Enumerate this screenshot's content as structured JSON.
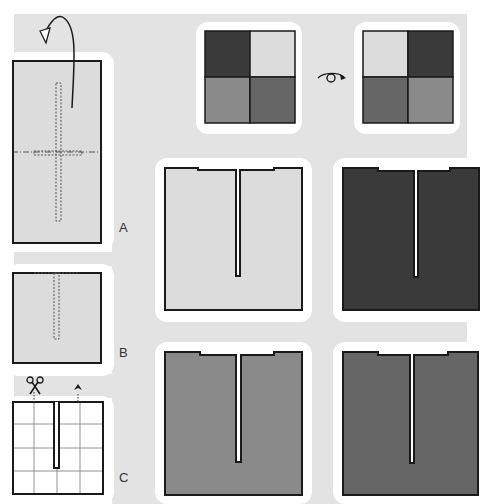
{
  "diagram": {
    "title": "",
    "steps": [
      {
        "id": "A",
        "label": "A",
        "description": "Rectangle with cross-shaped dotted cut guide; fold-over arrow at top"
      },
      {
        "id": "B",
        "label": "B",
        "description": "Folded square with dotted slit guide from top edge"
      },
      {
        "id": "C",
        "label": "C",
        "description": "4x4 grid square with slit cut from top; scissors and arrow markers"
      }
    ],
    "color_key": {
      "before": [
        "dark",
        "light",
        "mid",
        "darker-mid"
      ],
      "after": [
        "light",
        "dark",
        "darker-mid",
        "mid"
      ],
      "flip_symbol": "turn-over"
    },
    "results": [
      {
        "id": "result-light",
        "fill": "#dcdcdc"
      },
      {
        "id": "result-dark",
        "fill": "#3a3a3a"
      },
      {
        "id": "result-mid",
        "fill": "#8a8a8a"
      },
      {
        "id": "result-darker-mid",
        "fill": "#666666"
      }
    ],
    "colors": {
      "background": "#e3e3e3",
      "pad": "#ffffff",
      "stroke": "#1a1a1a",
      "paper": "#dcdcdc",
      "dark": "#3a3a3a",
      "mid": "#8a8a8a",
      "darker_mid": "#666666"
    }
  }
}
